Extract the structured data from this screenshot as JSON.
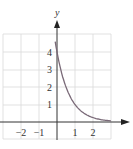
{
  "chart_data": {
    "type": "line",
    "title": "",
    "xlabel": "",
    "ylabel": "y",
    "xlim": [
      -3,
      3
    ],
    "ylim": [
      -1,
      5
    ],
    "grid": true,
    "x_ticks": [
      "−2",
      "−1",
      "1",
      "2"
    ],
    "y_ticks": [
      "1",
      "2",
      "3",
      "4"
    ],
    "series": [
      {
        "name": "y = 4(1/4)^x",
        "x": [
          -0.1,
          0,
          0.25,
          0.5,
          0.75,
          1,
          1.5,
          2,
          2.5,
          3
        ],
        "values": [
          4.6,
          4,
          2.83,
          2,
          1.41,
          1,
          0.5,
          0.25,
          0.125,
          0.06
        ]
      }
    ]
  },
  "axes": {
    "y_label": "y",
    "x_ticks": [
      {
        "label": "−2",
        "value": -2
      },
      {
        "label": "−1",
        "value": -1
      },
      {
        "label": "1",
        "value": 1
      },
      {
        "label": "2",
        "value": 2
      }
    ],
    "y_ticks": [
      {
        "label": "1",
        "value": 1
      },
      {
        "label": "2",
        "value": 2
      },
      {
        "label": "3",
        "value": 3
      },
      {
        "label": "4",
        "value": 4
      }
    ]
  },
  "colors": {
    "curve": "#7a6a78",
    "grid": "#d9d9d9",
    "axis": "#333333"
  }
}
